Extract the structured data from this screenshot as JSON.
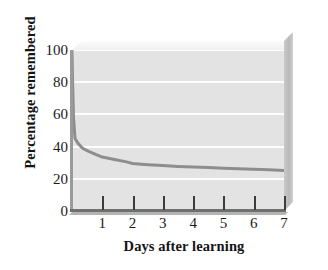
{
  "chart_data": {
    "type": "line",
    "title": "",
    "xlabel": "Days after learning",
    "ylabel": "Percentage remembered",
    "xlim": [
      0,
      7
    ],
    "ylim": [
      0,
      100
    ],
    "grid": true,
    "legend": false,
    "x_ticks": [
      1,
      2,
      3,
      4,
      5,
      6,
      7
    ],
    "x_tick_labels": [
      "1",
      "2",
      "3",
      "4",
      "5",
      "6",
      "7"
    ],
    "y_ticks": [
      0,
      20,
      40,
      60,
      80,
      100
    ],
    "y_tick_labels": [
      "0",
      "20",
      "40",
      "60",
      "80",
      "100"
    ],
    "series": [
      {
        "name": "Percentage remembered",
        "color": "#8d8d8d",
        "line_width": 3,
        "x": [
          0,
          0.02,
          0.05,
          0.1,
          0.2,
          0.35,
          0.55,
          0.8,
          1,
          1.4,
          1.8,
          2,
          2.5,
          3,
          3.5,
          4,
          4.5,
          5,
          5.5,
          6,
          6.5,
          7
        ],
        "y": [
          100,
          80,
          58,
          45,
          42,
          39,
          37,
          35,
          33.5,
          32,
          30.5,
          29.5,
          28.8,
          28.2,
          27.7,
          27.3,
          27,
          26.6,
          26.3,
          26,
          25.6,
          25.2
        ]
      }
    ]
  },
  "style": {
    "plot_background": "#e3e3e3",
    "gridline_color": "#fdfdfd",
    "curve_color": "#8d8d8d",
    "axis_color": "#6f6f6f",
    "side_wall_color": "#c2c2c2",
    "text_color": "#141414",
    "page_background": "#ffffff"
  }
}
